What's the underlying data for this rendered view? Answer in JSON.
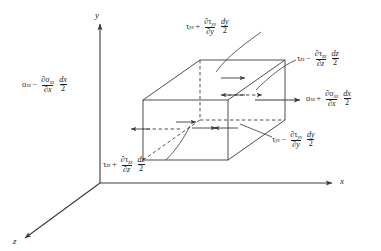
{
  "figure": {
    "kind": "stress-element-diagram",
    "line_color": "#3a3a3a",
    "text_color": "#231f20"
  },
  "axes": {
    "y_label": "y",
    "x_label": "x",
    "z_label": "z"
  },
  "labels": {
    "top": {
      "id": "tau-yx-plus",
      "base_sym": "τ",
      "base_sub": "yx",
      "op": "+",
      "num_partial": "∂τ",
      "num_sub": "yx",
      "den_partial": "∂y",
      "f2_num": "dy",
      "f2_den": "2"
    },
    "top_right": {
      "id": "tau-zx-minus",
      "base_sym": "τ",
      "base_sub": "zx",
      "op": "−",
      "num_partial": "∂τ",
      "num_sub": "zx",
      "den_partial": "∂z",
      "f2_num": "dz",
      "f2_den": "2"
    },
    "left": {
      "id": "sigma-xx-minus",
      "base_sym": "σ",
      "base_sub": "xx",
      "op": "−",
      "num_partial": "∂σ",
      "num_sub": "xx",
      "den_partial": "∂x",
      "f2_num": "dx",
      "f2_den": "2"
    },
    "right": {
      "id": "sigma-xx-plus",
      "base_sym": "σ",
      "base_sub": "xx",
      "op": "+",
      "num_partial": "∂σ",
      "num_sub": "xx",
      "den_partial": "∂x",
      "f2_num": "dx",
      "f2_den": "2"
    },
    "bottom_right": {
      "id": "tau-yx-minus",
      "base_sym": "τ",
      "base_sub": "yx",
      "op": "−",
      "num_partial": "∂τ",
      "num_sub": "yx",
      "den_partial": "∂y",
      "f2_num": "dy",
      "f2_den": "2"
    },
    "bottom_left": {
      "id": "tau-zx-plus",
      "base_sym": "τ",
      "base_sub": "zx",
      "op": "+",
      "num_partial": "∂τ",
      "num_sub": "zx",
      "den_partial": "∂z",
      "f2_num": "dz",
      "f2_den": "2"
    }
  }
}
